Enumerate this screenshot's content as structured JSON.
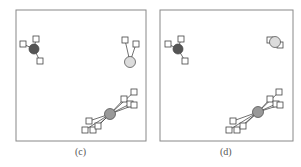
{
  "figure": {
    "panels": [
      {
        "id": "c",
        "caption": "(c)",
        "frame": {
          "x": 16,
          "y": 10,
          "w": 130,
          "h": 131
        },
        "clusters": [
          {
            "name": "dark",
            "color": "#555555",
            "center": [
              34,
              49
            ],
            "r": 5,
            "members": [
              [
                23,
                44
              ],
              [
                36,
                39
              ],
              [
                40,
                61
              ]
            ]
          },
          {
            "name": "light",
            "color": "#dcdcdc",
            "center": [
              130,
              62
            ],
            "r": 5.5,
            "members": [
              [
                125,
                40
              ],
              [
                136,
                44
              ]
            ]
          },
          {
            "name": "mid",
            "color": "#999999",
            "center": [
              110,
              114
            ],
            "r": 5.5,
            "members": [
              [
                134,
                92
              ],
              [
                124,
                99
              ],
              [
                130,
                104
              ],
              [
                134,
                105
              ],
              [
                89,
                121
              ],
              [
                85,
                130
              ],
              [
                93,
                130
              ],
              [
                98,
                126
              ]
            ]
          }
        ]
      },
      {
        "id": "d",
        "caption": "(d)",
        "frame": {
          "x": 160,
          "y": 10,
          "w": 133,
          "h": 131
        },
        "clusters": [
          {
            "name": "dark",
            "color": "#555555",
            "center": [
              178,
              49
            ],
            "r": 5,
            "members": [
              [
                168,
                44
              ],
              [
                181,
                39
              ],
              [
                185,
                61
              ]
            ]
          },
          {
            "name": "light",
            "color": "#dcdcdc",
            "center": [
              275,
              42
            ],
            "r": 5.5,
            "members": [
              [
                270,
                40
              ],
              [
                280,
                45
              ]
            ]
          },
          {
            "name": "mid",
            "color": "#999999",
            "center": [
              258,
              112
            ],
            "r": 5.5,
            "members": [
              [
                279,
                92
              ],
              [
                270,
                99
              ],
              [
                276,
                104
              ],
              [
                280,
                105
              ],
              [
                233,
                121
              ],
              [
                229,
                130
              ],
              [
                237,
                130
              ],
              [
                243,
                126
              ]
            ]
          }
        ]
      }
    ]
  }
}
